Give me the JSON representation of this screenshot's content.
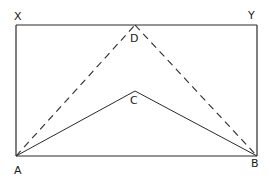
{
  "diagram": {
    "type": "geometry",
    "stroke_color": "#2a2a2a",
    "background": "#ffffff",
    "points": {
      "X": {
        "label": "X",
        "x": 16,
        "y": 25
      },
      "Y": {
        "label": "Y",
        "x": 257,
        "y": 25
      },
      "A": {
        "label": "A",
        "x": 16,
        "y": 156
      },
      "B": {
        "label": "B",
        "x": 257,
        "y": 156
      },
      "C": {
        "label": "C",
        "x": 135,
        "y": 91
      },
      "D": {
        "label": "D",
        "x": 135,
        "y": 25
      }
    },
    "segments": [
      {
        "from": "X",
        "to": "Y",
        "style": "solid"
      },
      {
        "from": "X",
        "to": "A",
        "style": "solid"
      },
      {
        "from": "Y",
        "to": "B",
        "style": "solid"
      },
      {
        "from": "A",
        "to": "B",
        "style": "solid"
      },
      {
        "from": "A",
        "to": "C",
        "style": "solid"
      },
      {
        "from": "C",
        "to": "B",
        "style": "solid"
      },
      {
        "from": "A",
        "to": "D",
        "style": "dashed"
      },
      {
        "from": "D",
        "to": "B",
        "style": "dashed"
      }
    ],
    "labels": {
      "x": "X",
      "y": "Y",
      "a": "A",
      "b": "B",
      "c": "C",
      "d": "D"
    }
  }
}
